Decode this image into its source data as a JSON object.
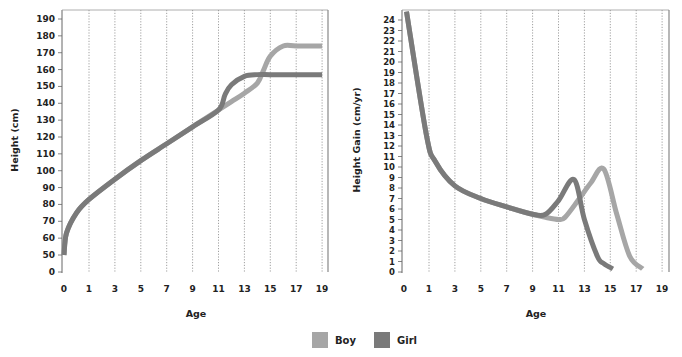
{
  "legend": {
    "items": [
      {
        "label": "Boy",
        "color": "#a6a6a6"
      },
      {
        "label": "Girl",
        "color": "#7a7a7a"
      }
    ]
  },
  "chart_data": [
    {
      "type": "line",
      "title": "",
      "xlabel": "Age",
      "ylabel": "Height (cm)",
      "x_ticks": [
        0,
        1,
        3,
        5,
        7,
        9,
        11,
        13,
        15,
        17,
        19
      ],
      "y_ticks": [
        0,
        50,
        60,
        70,
        80,
        90,
        100,
        110,
        120,
        130,
        140,
        150,
        160,
        170,
        180,
        190
      ],
      "ylim": [
        0,
        195
      ],
      "xlim": [
        0,
        19
      ],
      "grid": "vertical dotted",
      "series": [
        {
          "name": "Boy",
          "color": "#a6a6a6",
          "x": [
            0,
            0.1,
            0.5,
            1,
            3,
            5,
            7,
            9,
            11,
            12,
            13,
            14,
            14.5,
            15,
            16,
            17,
            19
          ],
          "y": [
            50,
            63,
            75,
            83,
            95,
            106,
            116,
            126,
            136,
            141,
            146,
            152,
            160,
            168,
            174,
            174,
            174
          ]
        },
        {
          "name": "Girl",
          "color": "#7a7a7a",
          "x": [
            0,
            0.1,
            0.5,
            1,
            3,
            5,
            7,
            9,
            11,
            11.5,
            12,
            13,
            14,
            15,
            17,
            19
          ],
          "y": [
            50,
            63,
            75,
            83,
            95,
            106,
            116,
            126,
            136,
            145,
            151,
            156,
            157,
            157,
            157,
            157
          ]
        }
      ]
    },
    {
      "type": "line",
      "title": "",
      "xlabel": "Age",
      "ylabel": "Height Gain (cm/yr)",
      "x_ticks": [
        0,
        1,
        3,
        5,
        7,
        9,
        11,
        13,
        15,
        17,
        19
      ],
      "y_ticks": [
        0,
        1,
        2,
        3,
        4,
        5,
        6,
        7,
        8,
        9,
        10,
        11,
        12,
        13,
        14,
        15,
        16,
        17,
        18,
        19,
        20,
        21,
        22,
        23,
        24
      ],
      "ylim": [
        0,
        24.8
      ],
      "xlim": [
        0,
        19
      ],
      "grid": "vertical dotted",
      "series": [
        {
          "name": "Boy",
          "color": "#a6a6a6",
          "x": [
            0.1,
            0.9,
            1.5,
            3,
            5,
            7,
            9,
            10,
            11,
            11.5,
            12.5,
            13.5,
            14.5,
            15.5,
            16.5,
            17.5
          ],
          "y": [
            24.8,
            13,
            10.5,
            8.2,
            7,
            6.2,
            5.5,
            5.2,
            5,
            5.2,
            6.8,
            8.5,
            9.8,
            5.5,
            1.5,
            0.3
          ]
        },
        {
          "name": "Girl",
          "color": "#7a7a7a",
          "x": [
            0.1,
            0.9,
            1.5,
            3,
            5,
            7,
            9,
            10,
            11,
            12.2,
            13,
            14,
            14.5,
            15.2
          ],
          "y": [
            24.8,
            13,
            10.5,
            8.2,
            7,
            6.2,
            5.5,
            5.5,
            6.8,
            8.8,
            5,
            1.5,
            0.8,
            0.3
          ]
        }
      ]
    }
  ]
}
